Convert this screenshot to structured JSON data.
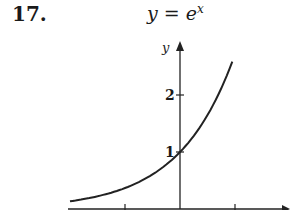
{
  "problem": {
    "number": "17.",
    "title_base": "y = e",
    "title_exp": "x"
  },
  "chart_data": {
    "type": "line",
    "xlabel": "x",
    "ylabel": "y",
    "function": "e^x",
    "x": [
      -2.0,
      -1.5,
      -1.0,
      -0.5,
      0.0,
      0.5,
      1.0
    ],
    "values": [
      0.135,
      0.223,
      0.368,
      0.607,
      1.0,
      1.649,
      2.718
    ],
    "x_ticks": [
      -1,
      0,
      1
    ],
    "y_ticks": [
      1,
      2
    ],
    "y_tick_labels": [
      "1",
      "2"
    ],
    "xlim": [
      -2,
      1.6
    ],
    "ylim": [
      0,
      2.9
    ],
    "grid": false,
    "legend": null,
    "annotations": [
      {
        "x": 0,
        "y": 1,
        "label": "1"
      }
    ]
  },
  "axes": {
    "y_label": "y",
    "tick_1": "1",
    "tick_2": "2"
  }
}
